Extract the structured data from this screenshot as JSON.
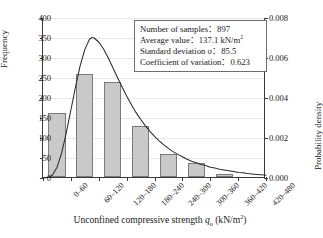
{
  "chart_data": {
    "type": "bar",
    "title": "",
    "subtitle": "",
    "xlabel": "Unconfined compressive strength qu (kN/m2)",
    "xlabel_parts": {
      "main": "Unconfined compressive strength ",
      "symbol": "q",
      "subscript": "u",
      "units": " (kN/m",
      "units_sup": "2",
      "units_end": ")"
    },
    "ylabel": "Frequency",
    "ylabel_right": "Probability density",
    "categories": [
      "0–60",
      "60–120",
      "120–180",
      "180–240",
      "240–300",
      "300–360",
      "360–420",
      "420–480"
    ],
    "values": [
      160,
      258,
      238,
      128,
      57,
      36,
      8,
      1
    ],
    "ylim": [
      0,
      400
    ],
    "yticks": [
      0,
      50,
      100,
      150,
      200,
      250,
      300,
      350,
      400
    ],
    "ytick_labels": [
      "0",
      "50",
      "100",
      "150",
      "200",
      "250",
      "300",
      "350",
      "400"
    ],
    "ylim_right": [
      0.0,
      0.008
    ],
    "yticks_right": [
      0.0,
      0.002,
      0.004,
      0.006,
      0.008
    ],
    "ytick_labels_right": [
      "0.000",
      "0.002",
      "0.004",
      "0.006",
      "0.008"
    ],
    "grid": true,
    "legend_position": "upper-right-inset",
    "series": [
      {
        "name": "Frequency histogram",
        "type": "bar",
        "axis": "left",
        "values": [
          160,
          258,
          238,
          128,
          57,
          36,
          8,
          1
        ],
        "bar_fill": "#c9c9c9",
        "bar_edge": "#7a7a7a"
      },
      {
        "name": "Lognormal probability density",
        "type": "line",
        "axis": "right",
        "line_color": "#2b2b2b",
        "peak_x": 105,
        "peak_value_left_axis": 351,
        "peak_value_right_axis": 0.00702,
        "points": [
          [
            0,
            0
          ],
          [
            10,
            1
          ],
          [
            20,
            7
          ],
          [
            30,
            26
          ],
          [
            40,
            62
          ],
          [
            50,
            112
          ],
          [
            60,
            170
          ],
          [
            70,
            228
          ],
          [
            80,
            281
          ],
          [
            90,
            321
          ],
          [
            100,
            347
          ],
          [
            105,
            351
          ],
          [
            110,
            350
          ],
          [
            120,
            340
          ],
          [
            130,
            323
          ],
          [
            140,
            301
          ],
          [
            150,
            277
          ],
          [
            160,
            252
          ],
          [
            170,
            228
          ],
          [
            180,
            205
          ],
          [
            190,
            184
          ],
          [
            200,
            164
          ],
          [
            210,
            147
          ],
          [
            220,
            131
          ],
          [
            230,
            117
          ],
          [
            240,
            104
          ],
          [
            250,
            93
          ],
          [
            260,
            83
          ],
          [
            270,
            74
          ],
          [
            280,
            66
          ],
          [
            290,
            59
          ],
          [
            300,
            53
          ],
          [
            310,
            47
          ],
          [
            320,
            42
          ],
          [
            330,
            38
          ],
          [
            340,
            34
          ],
          [
            350,
            31
          ],
          [
            360,
            27
          ],
          [
            370,
            25
          ],
          [
            380,
            22
          ],
          [
            390,
            20
          ],
          [
            400,
            18
          ],
          [
            410,
            16
          ],
          [
            420,
            14
          ],
          [
            430,
            13
          ],
          [
            440,
            11
          ],
          [
            450,
            10
          ],
          [
            460,
            9
          ],
          [
            470,
            8
          ],
          [
            480,
            7
          ]
        ]
      }
    ],
    "annotations": {
      "stats": [
        "Number of samples：897",
        "Average value：137.1 kN/m2",
        "Standard deviation σ：85.5",
        "Coefficient of variation：0.623"
      ]
    }
  },
  "stats_box": {
    "samples_label": "Number of samples",
    "samples_value": "897",
    "average_label": "Average value",
    "average_value": "137.1 kN/m",
    "average_unit_sup": "2",
    "stdev_label": "Standard deviation σ",
    "stdev_value": "85.5",
    "cov_label": "Coefficient of variation",
    "cov_value": "0.623",
    "separator": "："
  },
  "axes": {
    "left_title": "Frequency",
    "right_title": "Probability density",
    "x_title_main": "Unconfined compressive strength ",
    "x_title_symbol": "q",
    "x_title_sub": "u",
    "x_title_units_open": " (kN/m",
    "x_title_units_sup": "2",
    "x_title_units_close": ")"
  },
  "colors": {
    "bar_fill": "#c9c9c9",
    "bar_edge": "#7a7a7a",
    "axis": "#3a3a3a",
    "grid": "#e6e6e6",
    "curve": "#2b2b2b",
    "text": "#1a1a1a",
    "box_border": "#6d6d6d"
  }
}
